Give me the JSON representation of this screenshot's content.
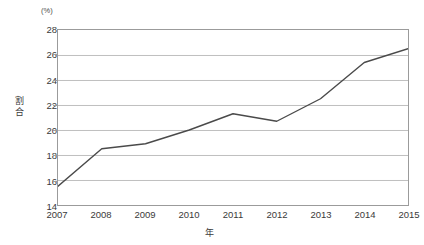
{
  "chart_data": {
    "type": "line",
    "title": "",
    "subtitle": "",
    "unit_label": "(%)",
    "xlabel": "年",
    "ylabel": "割合",
    "categories": [
      "2007",
      "2008",
      "2009",
      "2010",
      "2011",
      "2012",
      "2013",
      "2014",
      "2015"
    ],
    "x": [
      2007,
      2008,
      2009,
      2010,
      2011,
      2012,
      2013,
      2014,
      2015
    ],
    "series": [
      {
        "name": "割合",
        "values": [
          15.5,
          18.5,
          18.9,
          20.0,
          21.3,
          20.7,
          22.5,
          25.4,
          26.5
        ],
        "color": "#4a4a4a"
      }
    ],
    "ylim": [
      14,
      28
    ],
    "yticks": [
      14,
      16,
      18,
      20,
      22,
      24,
      26,
      28
    ],
    "ytick_labels": [
      "14",
      "16",
      "18",
      "20",
      "22",
      "24",
      "26",
      "28"
    ],
    "xtick_labels": [
      "2007",
      "2008",
      "2009",
      "2010",
      "2011",
      "2012",
      "2013",
      "2014",
      "2015"
    ],
    "grid": "horizontal",
    "gridline_color": "#bfbfbf",
    "axis_color": "#9b9b9b",
    "legend": "none",
    "legend_position": "none",
    "markers": "none",
    "background": "#ffffff"
  },
  "ylabel_chars": [
    "割",
    "合"
  ]
}
